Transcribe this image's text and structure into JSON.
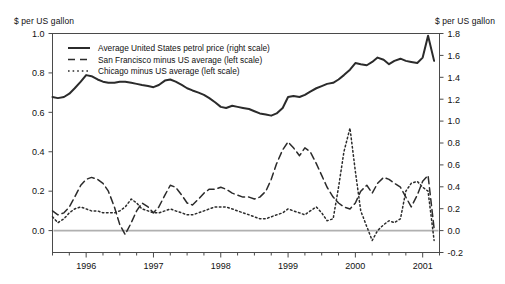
{
  "axis_titles": {
    "left": "$ per US gallon",
    "right": "$ per US gallon"
  },
  "legend": {
    "items": [
      {
        "label": "Average United States petrol price (right scale)",
        "style": "solid"
      },
      {
        "label": "San Francisco minus US average (left scale)",
        "style": "dashed"
      },
      {
        "label": "Chicago minus US average (left scale)",
        "style": "dotted"
      }
    ]
  },
  "ticks": {
    "left": [
      "1.0",
      "0.8",
      "0.6",
      "0.4",
      "0.2",
      "0.0"
    ],
    "right": [
      "1.8",
      "1.6",
      "1.4",
      "1.2",
      "1.0",
      "0.8",
      "0.6",
      "0.4",
      "0.2",
      "0.0",
      "-0.2"
    ],
    "x": [
      "1996",
      "1997",
      "1998",
      "1999",
      "2000",
      "2001"
    ]
  },
  "chart_data": {
    "type": "line",
    "title": "",
    "xlabel": "",
    "ylabel": "$ per US gallon",
    "ylabel_right": "$ per US gallon",
    "grid": false,
    "legend_position": "top-left-inside",
    "xlim": [
      1995.5,
      2001.25
    ],
    "ylim_left": [
      -0.1,
      1.0
    ],
    "ylim_right": [
      -0.2,
      1.8
    ],
    "x_tick_values": [
      1996,
      1997,
      1998,
      1999,
      2000,
      2001
    ],
    "minor_ticks_per_year": 4,
    "zero_line": 0.0,
    "series": [
      {
        "name": "Average United States petrol price (right scale)",
        "axis": "right",
        "style": "solid",
        "color": "#2b2b2b",
        "x": [
          1995.5,
          1995.58,
          1995.67,
          1995.75,
          1995.83,
          1995.92,
          1996.0,
          1996.08,
          1996.17,
          1996.25,
          1996.33,
          1996.42,
          1996.5,
          1996.58,
          1996.67,
          1996.75,
          1996.83,
          1996.92,
          1997.0,
          1997.08,
          1997.17,
          1997.25,
          1997.33,
          1997.42,
          1997.5,
          1997.58,
          1997.67,
          1997.75,
          1997.83,
          1997.92,
          1998.0,
          1998.08,
          1998.17,
          1998.25,
          1998.33,
          1998.42,
          1998.5,
          1998.58,
          1998.67,
          1998.75,
          1998.83,
          1998.92,
          1999.0,
          1999.08,
          1999.17,
          1999.25,
          1999.33,
          1999.42,
          1999.5,
          1999.58,
          1999.67,
          1999.75,
          1999.83,
          1999.92,
          2000.0,
          2000.08,
          2000.17,
          2000.25,
          2000.33,
          2000.42,
          2000.5,
          2000.58,
          2000.67,
          2000.75,
          2000.83,
          2000.92,
          2001.0,
          2001.08,
          2001.17
        ],
        "y": [
          1.22,
          1.21,
          1.22,
          1.25,
          1.3,
          1.36,
          1.42,
          1.41,
          1.38,
          1.36,
          1.35,
          1.35,
          1.36,
          1.36,
          1.35,
          1.34,
          1.33,
          1.32,
          1.31,
          1.33,
          1.37,
          1.38,
          1.36,
          1.33,
          1.3,
          1.28,
          1.26,
          1.24,
          1.21,
          1.17,
          1.13,
          1.12,
          1.14,
          1.13,
          1.12,
          1.11,
          1.09,
          1.07,
          1.06,
          1.05,
          1.07,
          1.12,
          1.22,
          1.23,
          1.22,
          1.24,
          1.27,
          1.3,
          1.32,
          1.34,
          1.35,
          1.38,
          1.42,
          1.47,
          1.53,
          1.52,
          1.51,
          1.54,
          1.58,
          1.56,
          1.52,
          1.55,
          1.57,
          1.55,
          1.54,
          1.53,
          1.58,
          1.78,
          1.55
        ]
      },
      {
        "name": "San Francisco minus US average (left scale)",
        "axis": "left",
        "style": "dashed",
        "color": "#2b2b2b",
        "x": [
          1995.5,
          1995.58,
          1995.67,
          1995.75,
          1995.83,
          1995.92,
          1996.0,
          1996.08,
          1996.17,
          1996.25,
          1996.33,
          1996.42,
          1996.5,
          1996.58,
          1996.67,
          1996.75,
          1996.83,
          1996.92,
          1997.0,
          1997.08,
          1997.17,
          1997.25,
          1997.33,
          1997.42,
          1997.5,
          1997.58,
          1997.67,
          1997.75,
          1997.83,
          1997.92,
          1998.0,
          1998.08,
          1998.17,
          1998.25,
          1998.33,
          1998.42,
          1998.5,
          1998.58,
          1998.67,
          1998.75,
          1998.83,
          1998.92,
          1999.0,
          1999.08,
          1999.17,
          1999.25,
          1999.33,
          1999.42,
          1999.5,
          1999.58,
          1999.67,
          1999.75,
          1999.83,
          1999.92,
          2000.0,
          2000.08,
          2000.17,
          2000.25,
          2000.33,
          2000.42,
          2000.5,
          2000.58,
          2000.67,
          2000.75,
          2000.83,
          2000.92,
          2001.0,
          2001.08,
          2001.17
        ],
        "y": [
          0.1,
          0.08,
          0.09,
          0.12,
          0.17,
          0.23,
          0.26,
          0.27,
          0.26,
          0.24,
          0.2,
          0.12,
          0.03,
          -0.02,
          0.04,
          0.1,
          0.14,
          0.12,
          0.09,
          0.12,
          0.18,
          0.23,
          0.22,
          0.18,
          0.14,
          0.13,
          0.16,
          0.19,
          0.21,
          0.21,
          0.22,
          0.21,
          0.19,
          0.18,
          0.17,
          0.17,
          0.16,
          0.17,
          0.2,
          0.26,
          0.34,
          0.41,
          0.45,
          0.42,
          0.38,
          0.42,
          0.4,
          0.34,
          0.28,
          0.22,
          0.17,
          0.14,
          0.12,
          0.11,
          0.14,
          0.2,
          0.23,
          0.19,
          0.24,
          0.27,
          0.26,
          0.24,
          0.22,
          0.17,
          0.12,
          0.18,
          0.25,
          0.28,
          0.01
        ]
      },
      {
        "name": "Chicago minus US average (left scale)",
        "axis": "left",
        "style": "dotted",
        "color": "#2b2b2b",
        "x": [
          1995.5,
          1995.58,
          1995.67,
          1995.75,
          1995.83,
          1995.92,
          1996.0,
          1996.08,
          1996.17,
          1996.25,
          1996.33,
          1996.42,
          1996.5,
          1996.58,
          1996.67,
          1996.75,
          1996.83,
          1996.92,
          1997.0,
          1997.08,
          1997.17,
          1997.25,
          1997.33,
          1997.42,
          1997.5,
          1997.58,
          1997.67,
          1997.75,
          1997.83,
          1997.92,
          1998.0,
          1998.08,
          1998.17,
          1998.25,
          1998.33,
          1998.42,
          1998.5,
          1998.58,
          1998.67,
          1998.75,
          1998.83,
          1998.92,
          1999.0,
          1999.08,
          1999.17,
          1999.25,
          1999.33,
          1999.42,
          1999.5,
          1999.58,
          1999.67,
          1999.75,
          1999.83,
          1999.92,
          2000.0,
          2000.08,
          2000.17,
          2000.25,
          2000.33,
          2000.42,
          2000.5,
          2000.58,
          2000.67,
          2000.75,
          2000.83,
          2000.92,
          2001.0,
          2001.08,
          2001.17
        ],
        "y": [
          0.07,
          0.04,
          0.06,
          0.09,
          0.11,
          0.12,
          0.11,
          0.1,
          0.1,
          0.09,
          0.09,
          0.09,
          0.1,
          0.12,
          0.16,
          0.14,
          0.11,
          0.1,
          0.09,
          0.09,
          0.1,
          0.11,
          0.1,
          0.09,
          0.08,
          0.08,
          0.09,
          0.1,
          0.11,
          0.12,
          0.12,
          0.12,
          0.11,
          0.1,
          0.09,
          0.08,
          0.07,
          0.06,
          0.06,
          0.07,
          0.08,
          0.09,
          0.11,
          0.1,
          0.09,
          0.08,
          0.1,
          0.12,
          0.09,
          0.05,
          0.06,
          0.22,
          0.4,
          0.52,
          0.3,
          0.1,
          0.02,
          -0.05,
          0.0,
          0.03,
          0.05,
          0.04,
          0.06,
          0.2,
          0.24,
          0.25,
          0.22,
          0.2,
          -0.05
        ]
      }
    ]
  }
}
